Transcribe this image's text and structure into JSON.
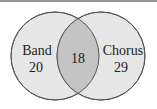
{
  "diagram": {
    "type": "venn",
    "sets": [
      {
        "label": "Band",
        "only_count": "20"
      },
      {
        "label": "Chorus",
        "only_count": "29"
      }
    ],
    "intersection_count": "18",
    "colors": {
      "circle_fill": "#e6e6e6",
      "intersection_fill": "#c4c4c4",
      "stroke": "#555555"
    }
  }
}
